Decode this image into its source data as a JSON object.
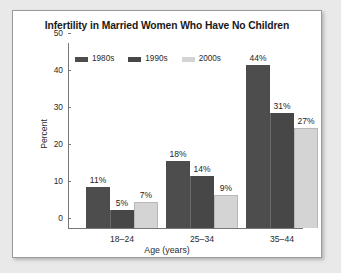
{
  "chart_data": {
    "type": "bar",
    "title": "Infertility in Married Women Who Have No Children",
    "xlabel": "Age (years)",
    "ylabel": "Percent",
    "categories": [
      "18–24",
      "25–34",
      "35–44"
    ],
    "series": [
      {
        "name": "1980s",
        "color": "#4d4d4d",
        "values": [
          11,
          18,
          44
        ],
        "labels": [
          "11%",
          "18%",
          "44%"
        ]
      },
      {
        "name": "1990s",
        "color": "#474747",
        "values": [
          5,
          14,
          31
        ],
        "labels": [
          "5%",
          "14%",
          "31%"
        ]
      },
      {
        "name": "2000s",
        "color": "#d4d4d4",
        "values": [
          7,
          9,
          27
        ],
        "labels": [
          "7%",
          "9%",
          "27%"
        ]
      }
    ],
    "ylim": [
      0,
      50
    ],
    "yticks": [
      "0",
      "10",
      "20",
      "30",
      "40",
      "50"
    ],
    "ytick_values": [
      0,
      10,
      20,
      30,
      40,
      50
    ],
    "grid": false,
    "legend_position": "top-left",
    "axis_color": "#777777",
    "background": "#ffffff",
    "page_background": "#e9e9e9"
  }
}
